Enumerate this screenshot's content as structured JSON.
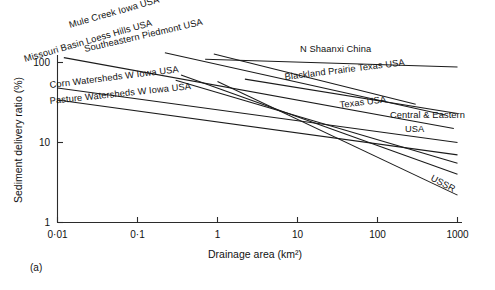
{
  "figure": {
    "caption": "(a)"
  },
  "chart_data": {
    "type": "line",
    "title": "",
    "subtitle": "",
    "xlabel": "Drainage area (km²)",
    "ylabel": "Sediment delivery ratio (%)",
    "xscale": "log",
    "yscale": "log",
    "xlim": [
      0.01,
      1000
    ],
    "ylim": [
      1,
      100
    ],
    "grid": false,
    "legend_position": "inline-labels",
    "xticks": [
      "0·01",
      "0·1",
      "1",
      "10",
      "100",
      "1000"
    ],
    "xtick_values": [
      0.01,
      0.1,
      1,
      10,
      100,
      1000
    ],
    "yticks": [
      "1",
      "10",
      "100"
    ],
    "ytick_values": [
      1,
      10,
      100
    ],
    "series": [
      {
        "name": "N Shaanxi China",
        "label": "N Shaanxi China",
        "x": [
          0.7,
          1000
        ],
        "y": [
          110,
          88
        ],
        "label_x": 300,
        "label_y": 52,
        "label_rotation": 0
      },
      {
        "name": "Mule Creek Iowa USA",
        "label": "Mule Creek Iowa USA",
        "x": [
          0.9,
          300
        ],
        "y": [
          128,
          30
        ],
        "label_x": 70,
        "label_y": 28,
        "label_rotation": -16
      },
      {
        "name": "Southeastern Piedmont USA",
        "label": "Southeastern Piedmont USA",
        "x": [
          0.22,
          700
        ],
        "y": [
          132,
          22
        ],
        "label_x": 85,
        "label_y": 52,
        "label_rotation": -13
      },
      {
        "name": "Missouri Basin Loess Hills USA",
        "label": "Missouri Basin Loess Hills USA",
        "x": [
          0.012,
          900
        ],
        "y": [
          115,
          15
        ],
        "label_x": 25,
        "label_y": 62,
        "label_rotation": -16
      },
      {
        "name": "Blackland Prairie Texas USA",
        "label": "Blackland Prairie Texas USA",
        "x": [
          2.2,
          1000
        ],
        "y": [
          62,
          23
        ],
        "label_x": 285,
        "label_y": 80,
        "label_rotation": -7
      },
      {
        "name": "Corn Watersheds W Iowa USA",
        "label": "Corn Watersheds W Iowa USA",
        "x": [
          0.01,
          1000
        ],
        "y": [
          48,
          10
        ],
        "label_x": 50,
        "label_y": 88,
        "label_rotation": -7
      },
      {
        "name": "Texas USA",
        "label": "Texas USA",
        "x": [
          0.3,
          1000
        ],
        "y": [
          60,
          5.5
        ],
        "label_x": 340,
        "label_y": 108,
        "label_rotation": -7
      },
      {
        "name": "Pasture Watersheds W Iowa USA",
        "label": "Pasture Watersheds W Iowa USA",
        "x": [
          0.01,
          1000
        ],
        "y": [
          34,
          7
        ],
        "label_x": 50,
        "label_y": 104,
        "label_rotation": -6
      },
      {
        "name": "Central & Eastern USA",
        "label_line1": "Central & Eastern",
        "label_line2": "USA",
        "label": "Central & Eastern USA",
        "x": [
          0.35,
          1000
        ],
        "y": [
          70,
          4
        ],
        "label_x": 390,
        "label_y": 118,
        "label2_x": 405,
        "label2_y": 132,
        "label_rotation": 0
      },
      {
        "name": "USSR",
        "label": "USSR",
        "x": [
          1.0,
          1000
        ],
        "y": [
          58,
          2.2
        ],
        "label_x": 430,
        "label_y": 180,
        "label_rotation": 28
      }
    ]
  }
}
